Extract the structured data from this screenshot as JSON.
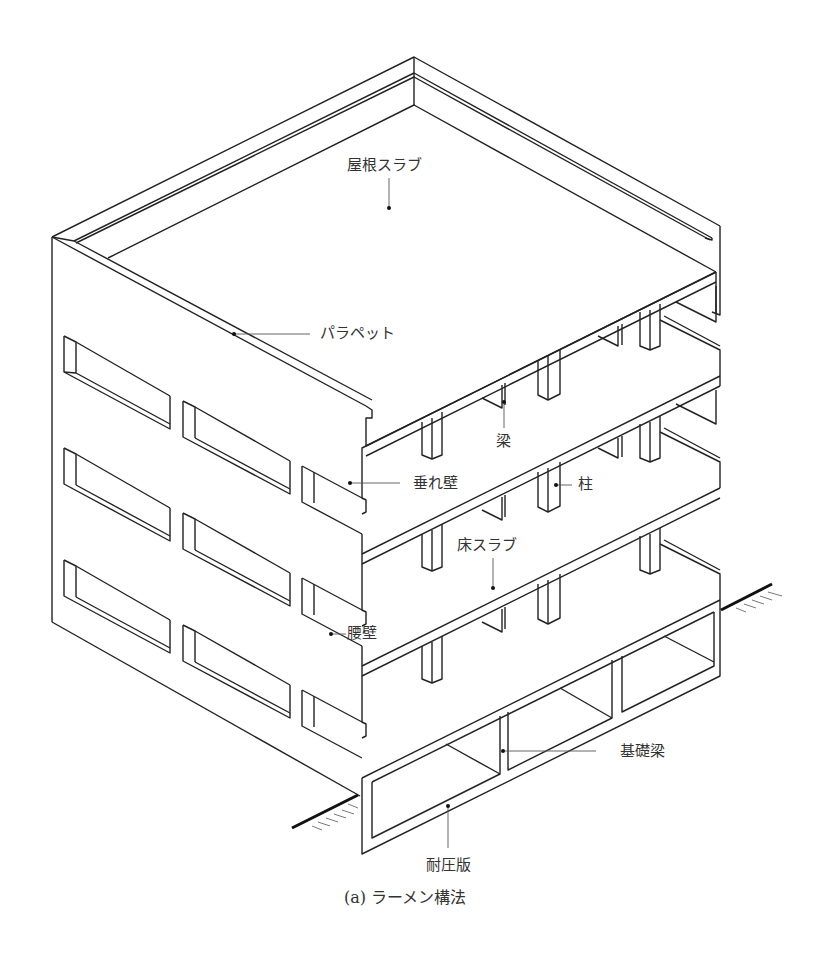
{
  "figure": {
    "title": "ラーメン構法",
    "caption_prefix": "(a)",
    "caption": "(a)  ラーメン構法"
  },
  "labels": {
    "roof_slab": "屋根スラブ",
    "parapet": "パラペット",
    "beam": "梁",
    "hanging_wall": "垂れ壁",
    "column": "柱",
    "floor_slab": "床スラブ",
    "spandrel_wall": "腰壁",
    "foundation_beam": "基礎梁",
    "mat_slab": "耐圧版"
  },
  "colors": {
    "line": "#222222",
    "leader": "#555555",
    "text": "#333333",
    "background": "#ffffff"
  }
}
